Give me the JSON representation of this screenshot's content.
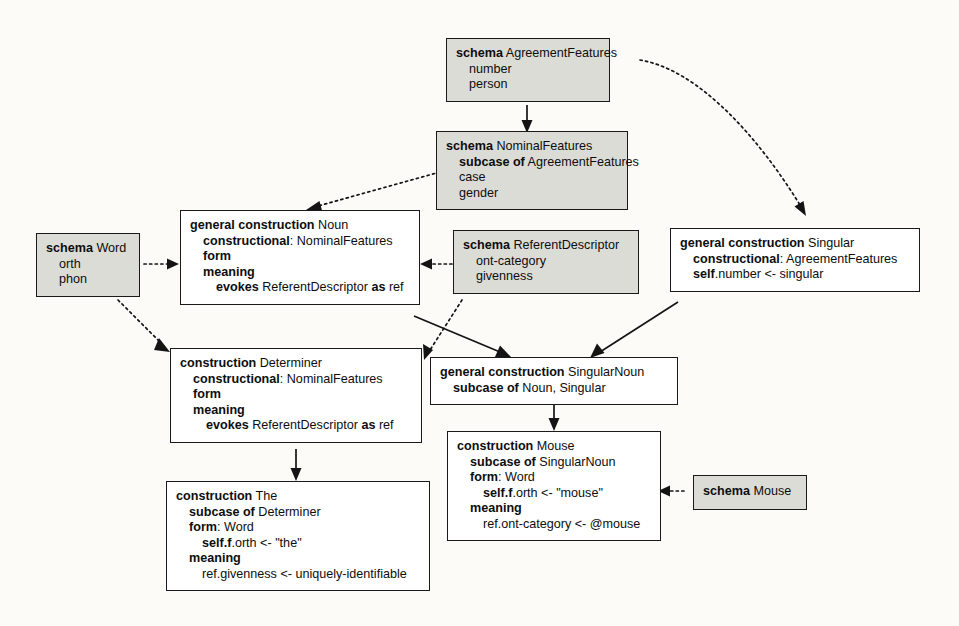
{
  "diagram": {
    "background_color": "#fcfbf8",
    "schema_fill": "#dcdcd7",
    "construction_fill": "#ffffff",
    "border_color": "#1a1a1a"
  },
  "nodes": {
    "agreement_features": {
      "kind": "schema",
      "lines": [
        {
          "text": "schema AgreementFeatures",
          "bold_prefix": "schema",
          "indent": 0
        },
        {
          "text": "number",
          "bold_prefix": "",
          "indent": 1
        },
        {
          "text": "person",
          "bold_prefix": "",
          "indent": 1
        }
      ]
    },
    "nominal_features": {
      "kind": "schema",
      "lines": [
        {
          "text": "schema NominalFeatures",
          "bold_prefix": "schema",
          "indent": 0
        },
        {
          "text": "subcase of AgreementFeatures",
          "bold_prefix": "subcase of",
          "indent": 1
        },
        {
          "text": "case",
          "bold_prefix": "",
          "indent": 1
        },
        {
          "text": "gender",
          "bold_prefix": "",
          "indent": 1
        }
      ]
    },
    "word": {
      "kind": "schema",
      "lines": [
        {
          "text": "schema Word",
          "bold_prefix": "schema",
          "indent": 0
        },
        {
          "text": "orth",
          "bold_prefix": "",
          "indent": 1
        },
        {
          "text": "phon",
          "bold_prefix": "",
          "indent": 1
        }
      ]
    },
    "referent_descriptor": {
      "kind": "schema",
      "lines": [
        {
          "text": "schema ReferentDescriptor",
          "bold_prefix": "schema",
          "indent": 0
        },
        {
          "text": "ont-category",
          "bold_prefix": "",
          "indent": 1
        },
        {
          "text": "givenness",
          "bold_prefix": "",
          "indent": 1
        }
      ]
    },
    "mouse_schema": {
      "kind": "schema",
      "lines": [
        {
          "text": "schema Mouse",
          "bold_prefix": "schema",
          "indent": 0
        }
      ]
    },
    "noun": {
      "kind": "construction",
      "lines": [
        {
          "text": "general construction Noun",
          "bold_prefix": "general construction",
          "indent": 0
        },
        {
          "text": "constructional: NominalFeatures",
          "bold_prefix": "constructional",
          "indent": 1
        },
        {
          "text": "form",
          "bold_prefix": "form",
          "indent": 1
        },
        {
          "text": "meaning",
          "bold_prefix": "meaning",
          "indent": 1
        },
        {
          "text": "evokes ReferentDescriptor as ref",
          "bold_prefix": "evokes",
          "indent": 2
        }
      ]
    },
    "singular": {
      "kind": "construction",
      "lines": [
        {
          "text": "general construction Singular",
          "bold_prefix": "general construction",
          "indent": 0
        },
        {
          "text": "constructional: AgreementFeatures",
          "bold_prefix": "constructional",
          "indent": 1
        },
        {
          "text": "self.number <- singular",
          "bold_prefix": "self",
          "indent": 1
        }
      ]
    },
    "determiner": {
      "kind": "construction",
      "lines": [
        {
          "text": "construction Determiner",
          "bold_prefix": "construction",
          "indent": 0
        },
        {
          "text": "constructional: NominalFeatures",
          "bold_prefix": "constructional",
          "indent": 1
        },
        {
          "text": "form",
          "bold_prefix": "form",
          "indent": 1
        },
        {
          "text": "meaning",
          "bold_prefix": "meaning",
          "indent": 1
        },
        {
          "text": "evokes ReferentDescriptor as ref",
          "bold_prefix": "evokes",
          "indent": 2
        }
      ]
    },
    "singular_noun": {
      "kind": "construction",
      "lines": [
        {
          "text": "general construction SingularNoun",
          "bold_prefix": "general construction",
          "indent": 0
        },
        {
          "text": "subcase of Noun, Singular",
          "bold_prefix": "subcase of",
          "indent": 1
        }
      ]
    },
    "mouse_cxn": {
      "kind": "construction",
      "lines": [
        {
          "text": "construction Mouse",
          "bold_prefix": "construction",
          "indent": 0
        },
        {
          "text": "subcase of SingularNoun",
          "bold_prefix": "subcase of",
          "indent": 1
        },
        {
          "text": "form: Word",
          "bold_prefix": "form",
          "indent": 1
        },
        {
          "text": "self.f.orth <- \"mouse\"",
          "bold_prefix": "self.f",
          "indent": 2
        },
        {
          "text": "meaning",
          "bold_prefix": "meaning",
          "indent": 1
        },
        {
          "text": "ref.ont-category <- @mouse",
          "bold_prefix": "",
          "indent": 2
        }
      ]
    },
    "the_cxn": {
      "kind": "construction",
      "lines": [
        {
          "text": "construction The",
          "bold_prefix": "construction",
          "indent": 0
        },
        {
          "text": "subcase of Determiner",
          "bold_prefix": "subcase of",
          "indent": 1
        },
        {
          "text": "form: Word",
          "bold_prefix": "form",
          "indent": 1
        },
        {
          "text": "self.f.orth <- \"the\"",
          "bold_prefix": "self.f",
          "indent": 2
        },
        {
          "text": "meaning",
          "bold_prefix": "meaning",
          "indent": 1
        },
        {
          "text": "ref.givenness <- uniquely-identifiable",
          "bold_prefix": "",
          "indent": 2
        }
      ]
    }
  },
  "edges": [
    {
      "from": "agreement_features",
      "to": "nominal_features",
      "style": "solid",
      "relation": "subcase"
    },
    {
      "from": "agreement_features",
      "to": "singular",
      "style": "dotted",
      "relation": "evokes"
    },
    {
      "from": "nominal_features",
      "to": "noun",
      "style": "dotted",
      "relation": "evokes"
    },
    {
      "from": "word",
      "to": "noun",
      "style": "dotted",
      "relation": "evokes"
    },
    {
      "from": "word",
      "to": "determiner",
      "style": "dotted",
      "relation": "evokes"
    },
    {
      "from": "referent_descriptor",
      "to": "noun",
      "style": "dotted",
      "relation": "evokes"
    },
    {
      "from": "referent_descriptor",
      "to": "determiner",
      "style": "dotted",
      "relation": "evokes"
    },
    {
      "from": "noun",
      "to": "singular_noun",
      "style": "solid",
      "relation": "subcase"
    },
    {
      "from": "singular",
      "to": "singular_noun",
      "style": "solid",
      "relation": "subcase"
    },
    {
      "from": "singular_noun",
      "to": "mouse_cxn",
      "style": "solid",
      "relation": "subcase"
    },
    {
      "from": "determiner",
      "to": "the_cxn",
      "style": "solid",
      "relation": "subcase"
    },
    {
      "from": "mouse_schema",
      "to": "mouse_cxn",
      "style": "dotted",
      "relation": "evokes"
    }
  ]
}
